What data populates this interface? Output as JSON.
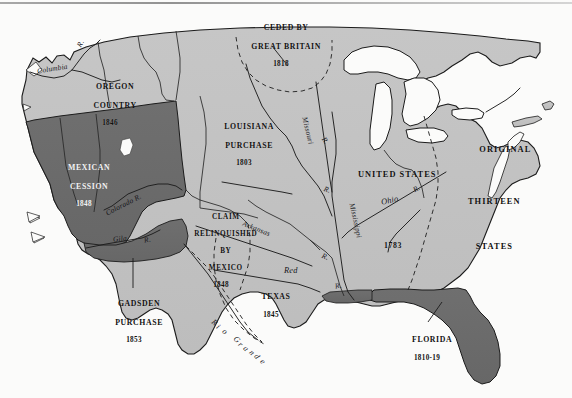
{
  "figure": {
    "kind": "historical-map",
    "colors": {
      "page": "#fbfbfa",
      "land_light": "#c2c2c2",
      "land_dark": "#6c6c6c",
      "water": "#ffffff",
      "outline": "#1b1b1b",
      "label_text": "#111111"
    }
  },
  "territories": [
    {
      "id": "ceded-by-great-britain",
      "name_lines": [
        "CEDED BY",
        "GREAT BRITAIN"
      ],
      "year": "1818",
      "shade": "light",
      "has_leader_line": true
    },
    {
      "id": "oregon-country",
      "name_lines": [
        "OREGON",
        "COUNTRY"
      ],
      "year": "1846",
      "shade": "light",
      "has_leader_line": false
    },
    {
      "id": "louisiana-purchase",
      "name_lines": [
        "LOUISIANA",
        "PURCHASE"
      ],
      "year": "1803",
      "shade": "light",
      "has_leader_line": false
    },
    {
      "id": "mexican-cession",
      "name_lines": [
        "MEXICAN",
        "CESSION"
      ],
      "year": "1848",
      "shade": "dark",
      "has_leader_line": false
    },
    {
      "id": "claim-relinquished-by-mexico",
      "name_lines": [
        "CLAIM",
        "RELINQUISHED",
        "BY",
        "MEXICO"
      ],
      "year": "1848",
      "shade": "light",
      "has_leader_line": false
    },
    {
      "id": "gadsden-purchase",
      "name_lines": [
        "GADSDEN",
        "PURCHASE"
      ],
      "year": "1853",
      "shade": "dark",
      "has_leader_line": true
    },
    {
      "id": "texas",
      "name_lines": [
        "TEXAS"
      ],
      "year": "1845",
      "shade": "light",
      "has_leader_line": false
    },
    {
      "id": "florida",
      "name_lines": [
        "FLORIDA"
      ],
      "year": "1810-19",
      "shade": "dark",
      "has_leader_line": true
    },
    {
      "id": "original-thirteen-states",
      "name_lines": [
        "UNITED STATES",
        "ORIGINAL",
        "THIRTEEN",
        "STATES"
      ],
      "year": "1783",
      "shade": "light",
      "has_leader_line": false
    }
  ],
  "labels": {
    "ceded_line1": "CEDED BY",
    "ceded_line2": "GREAT BRITAIN",
    "ceded_year": "1818",
    "oregon_line1": "OREGON",
    "oregon_line2": "COUNTRY",
    "oregon_year": "1846",
    "louisiana_line1": "LOUISIANA",
    "louisiana_line2": "PURCHASE",
    "louisiana_year": "1803",
    "mexican_line1": "MEXICAN",
    "mexican_line2": "CESSION",
    "mexican_year": "1848",
    "claim_line1": "CLAIM",
    "claim_line2": "RELINQUISHED",
    "claim_line3": "BY",
    "claim_line4": "MEXICO",
    "claim_year": "1848",
    "gadsden_line1": "GADSDEN",
    "gadsden_line2": "PURCHASE",
    "gadsden_year": "1853",
    "texas_name": "TEXAS",
    "texas_year": "1845",
    "florida_name": "FLORIDA",
    "florida_year": "1810-19",
    "united_states": "UNITED STATES",
    "original": "ORIGINAL",
    "thirteen": "THIRTEEN",
    "states": "STATES",
    "us_year": "1783"
  },
  "rivers": [
    {
      "id": "columbia",
      "name": "Columbia"
    },
    {
      "id": "columbia-r",
      "name": "R."
    },
    {
      "id": "colorado",
      "name": "Colorado R."
    },
    {
      "id": "gila",
      "name": "Gila"
    },
    {
      "id": "gila-r",
      "name": "R."
    },
    {
      "id": "missouri",
      "name": "Missouri"
    },
    {
      "id": "missouri-r",
      "name": "R."
    },
    {
      "id": "missouri-branch-r",
      "name": "R."
    },
    {
      "id": "arkansas",
      "name": "Arkansas"
    },
    {
      "id": "arkansas-r",
      "name": "R."
    },
    {
      "id": "red",
      "name": "Red"
    },
    {
      "id": "red-r",
      "name": "R."
    },
    {
      "id": "mississippi",
      "name": "Mississippi"
    },
    {
      "id": "mississippi-lower",
      "name": "R."
    },
    {
      "id": "ohio",
      "name": "Ohio"
    },
    {
      "id": "ohio-r",
      "name": "R."
    },
    {
      "id": "rio-grande",
      "name": "Rio Grande"
    }
  ],
  "river_labels": {
    "columbia": "Columbia",
    "columbia_r": "R.",
    "colorado": "Colorado R.",
    "gila": "Gila",
    "gila_r": "R.",
    "missouri": "Missouri",
    "missouri_r": "R.",
    "missouri_branch_r": "R.",
    "arkansas": "Arkansas",
    "arkansas_r": "R.",
    "red": "Red",
    "red_r": "R.",
    "mississippi": "Mississippi",
    "mississippi_r": "R.",
    "ohio": "Ohio",
    "ohio_r": "R."
  },
  "rio_grande_letters": [
    "R",
    "i",
    "o",
    " ",
    "G",
    "r",
    "a",
    "n",
    "d",
    "e"
  ]
}
